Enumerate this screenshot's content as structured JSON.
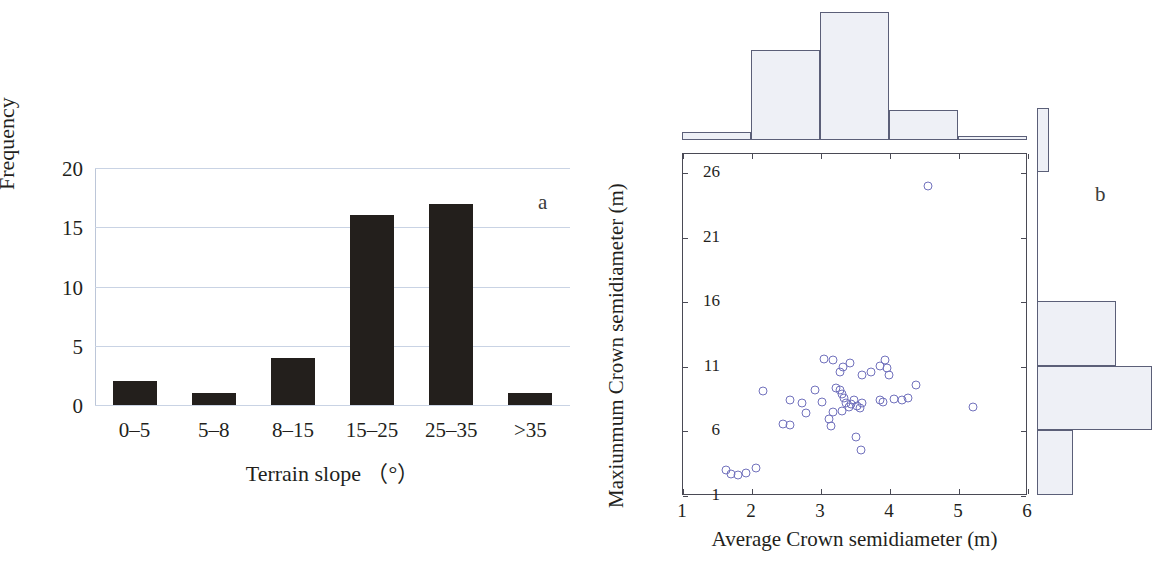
{
  "figure": {
    "panel_a_label": "a",
    "panel_b_label": "b"
  },
  "chart_data": [
    {
      "type": "bar",
      "panel": "a",
      "title": "",
      "xlabel": "Terrain slope （°）",
      "ylabel": "Frequency",
      "categories": [
        "0–5",
        "5–8",
        "8–15",
        "15–25",
        "25–35",
        ">35"
      ],
      "values": [
        2,
        1,
        4,
        16,
        17,
        1
      ],
      "yticks": [
        0,
        5,
        10,
        15,
        20
      ],
      "ylim": [
        0,
        20
      ],
      "grid": true,
      "bar_color": "#231f1c",
      "grid_color": "#c9d3e4",
      "legend": "none"
    },
    {
      "type": "scatter",
      "panel": "b",
      "title": "",
      "xlabel": "Average Crown semidiameter (m)",
      "ylabel": "Maxiunmum Crown semidiameter (m)",
      "xticks": [
        1,
        2,
        3,
        4,
        5,
        6
      ],
      "yticks": [
        1,
        6,
        11,
        16,
        21,
        26
      ],
      "xlim": [
        1,
        6
      ],
      "ylim": [
        1,
        27.5
      ],
      "grid": false,
      "legend": "none",
      "marker": "open-circle",
      "marker_color": "#7272bd",
      "points": [
        {
          "x": 4.55,
          "y": 25.0
        },
        {
          "x": 3.05,
          "y": 11.6
        },
        {
          "x": 3.18,
          "y": 11.5
        },
        {
          "x": 3.32,
          "y": 11.0
        },
        {
          "x": 3.42,
          "y": 11.3
        },
        {
          "x": 3.28,
          "y": 10.6
        },
        {
          "x": 3.85,
          "y": 11.1
        },
        {
          "x": 3.93,
          "y": 11.5
        },
        {
          "x": 3.95,
          "y": 10.9
        },
        {
          "x": 3.98,
          "y": 10.4
        },
        {
          "x": 3.72,
          "y": 10.6
        },
        {
          "x": 3.6,
          "y": 10.4
        },
        {
          "x": 2.16,
          "y": 9.1
        },
        {
          "x": 2.92,
          "y": 9.2
        },
        {
          "x": 2.72,
          "y": 8.2
        },
        {
          "x": 2.55,
          "y": 8.4
        },
        {
          "x": 2.78,
          "y": 7.4
        },
        {
          "x": 2.45,
          "y": 6.6
        },
        {
          "x": 2.55,
          "y": 6.5
        },
        {
          "x": 3.02,
          "y": 8.3
        },
        {
          "x": 3.22,
          "y": 9.4
        },
        {
          "x": 3.28,
          "y": 9.2
        },
        {
          "x": 3.3,
          "y": 8.9
        },
        {
          "x": 3.34,
          "y": 8.6
        },
        {
          "x": 3.36,
          "y": 8.2
        },
        {
          "x": 3.4,
          "y": 7.9
        },
        {
          "x": 3.44,
          "y": 8.1
        },
        {
          "x": 3.48,
          "y": 8.4
        },
        {
          "x": 3.52,
          "y": 8.0
        },
        {
          "x": 3.56,
          "y": 7.8
        },
        {
          "x": 3.6,
          "y": 8.2
        },
        {
          "x": 3.3,
          "y": 7.6
        },
        {
          "x": 3.18,
          "y": 7.5
        },
        {
          "x": 3.12,
          "y": 7.0
        },
        {
          "x": 3.86,
          "y": 8.4
        },
        {
          "x": 3.9,
          "y": 8.3
        },
        {
          "x": 4.06,
          "y": 8.5
        },
        {
          "x": 4.18,
          "y": 8.4
        },
        {
          "x": 4.26,
          "y": 8.6
        },
        {
          "x": 4.38,
          "y": 9.6
        },
        {
          "x": 5.2,
          "y": 7.9
        },
        {
          "x": 3.5,
          "y": 5.6
        },
        {
          "x": 3.58,
          "y": 4.6
        },
        {
          "x": 3.14,
          "y": 6.4
        },
        {
          "x": 1.62,
          "y": 3.0
        },
        {
          "x": 1.7,
          "y": 2.7
        },
        {
          "x": 1.8,
          "y": 2.6
        },
        {
          "x": 1.92,
          "y": 2.8
        },
        {
          "x": 2.06,
          "y": 3.2
        }
      ]
    },
    {
      "type": "bar",
      "panel": "b-marginal-top",
      "orientation": "vertical",
      "title": "",
      "xlabel": "",
      "ylabel": "",
      "bin_edges": [
        1,
        2,
        3,
        4,
        5,
        6
      ],
      "values": [
        1,
        12,
        17,
        4,
        0.5
      ],
      "fill_color": "#eef0f6",
      "edge_color": "#5b5f78",
      "grid": false,
      "legend": "none"
    },
    {
      "type": "bar",
      "panel": "b-marginal-right",
      "orientation": "horizontal",
      "title": "",
      "xlabel": "",
      "ylabel": "",
      "bin_edges": [
        1,
        6,
        11,
        16,
        21,
        26
      ],
      "values": [
        6,
        19,
        13,
        0,
        0,
        2
      ],
      "fill_color": "#eef0f6",
      "edge_color": "#5b5f78",
      "grid": false,
      "legend": "none"
    }
  ]
}
